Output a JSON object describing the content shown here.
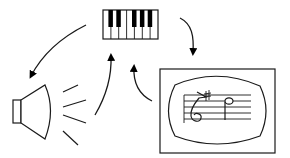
{
  "diagram": {
    "title": "",
    "colors": {
      "stroke": "#1a1a1a",
      "background": "#ffffff",
      "fill": "#000000"
    },
    "nodes": [
      {
        "id": "keyboard",
        "label": "",
        "icon": "piano-keyboard-icon",
        "white_keys": 7,
        "black_keys": 5
      },
      {
        "id": "speaker",
        "label": "",
        "icon": "speaker-icon",
        "sound_lines": 4
      },
      {
        "id": "score-display",
        "label": "",
        "icon": "music-score-display-icon",
        "contents": [
          "treble-clef",
          "staff-5-lines",
          "half-note"
        ]
      }
    ],
    "edges": [
      {
        "from": "keyboard",
        "to": "speaker",
        "style": "curved-arrow"
      },
      {
        "from": "keyboard",
        "to": "score-display",
        "style": "curved-arrow"
      },
      {
        "from": "speaker",
        "to": "keyboard",
        "style": "curved-arrow"
      },
      {
        "from": "score-display",
        "to": "keyboard",
        "style": "curved-arrow"
      }
    ]
  }
}
